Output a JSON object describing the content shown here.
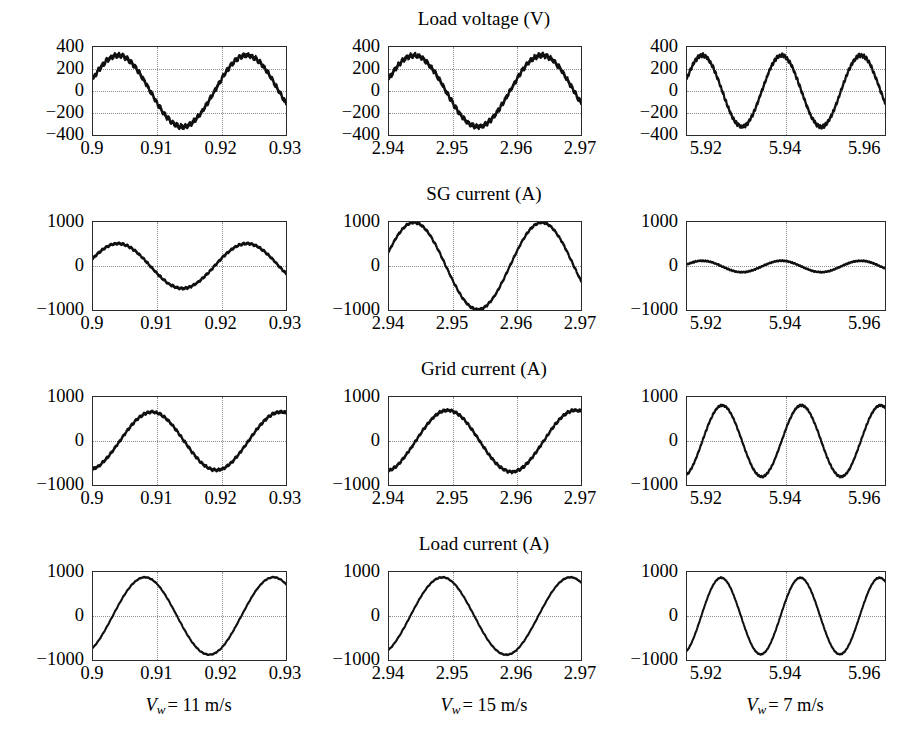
{
  "figure": {
    "rows": [
      {
        "key": "load_voltage",
        "title": "Load voltage (V)",
        "ytick_labels": [
          "400",
          "200",
          "0",
          "−200",
          "−400"
        ],
        "ylim": [
          -400,
          400
        ],
        "gridline_values": [
          200,
          0,
          -200
        ]
      },
      {
        "key": "sg_current",
        "title": "SG current (A)",
        "ytick_labels": [
          "1000",
          "0",
          "−1000"
        ],
        "ylim": [
          -1000,
          1000
        ],
        "gridline_values": [
          0
        ]
      },
      {
        "key": "grid_current",
        "title": "Grid current (A)",
        "ytick_labels": [
          "1000",
          "0",
          "−1000"
        ],
        "ylim": [
          -1000,
          1000
        ],
        "gridline_values": [
          0
        ]
      },
      {
        "key": "load_current",
        "title": "Load current (A)",
        "ytick_labels": [
          "1000",
          "0",
          "−1000"
        ],
        "ylim": [
          -1000,
          1000
        ],
        "gridline_values": [
          0
        ]
      }
    ],
    "columns": [
      {
        "key": "col_11ms",
        "caption_prefix": "V",
        "caption_sub": "w",
        "caption_value": "= 11 m/s",
        "caption_text": "Vw = 11 m/s",
        "xtick_labels": [
          "0.9",
          "0.91",
          "0.92",
          "0.93"
        ],
        "xtick_values": [
          0.9,
          0.91,
          0.92,
          0.93
        ],
        "xlim": [
          0.9,
          0.93
        ],
        "gridline_values": [
          0.91,
          0.92
        ]
      },
      {
        "key": "col_15ms",
        "caption_prefix": "V",
        "caption_sub": "w",
        "caption_value": "= 15 m/s",
        "caption_text": "Vw = 15 m/s",
        "xtick_labels": [
          "2.94",
          "2.95",
          "2.96",
          "2.97"
        ],
        "xtick_values": [
          2.94,
          2.95,
          2.96,
          2.97
        ],
        "xlim": [
          2.94,
          2.97
        ],
        "gridline_values": [
          2.95,
          2.96
        ]
      },
      {
        "key": "col_7ms",
        "caption_prefix": "V",
        "caption_sub": "w",
        "caption_value": "= 7 m/s",
        "caption_text": "Vw = 7 m/s",
        "xtick_labels": [
          "5.92",
          "5.94",
          "5.96"
        ],
        "xtick_values": [
          5.92,
          5.94,
          5.96
        ],
        "xlim": [
          5.915,
          5.965
        ],
        "gridline_values": [
          5.94
        ]
      }
    ]
  },
  "chart_data": {
    "type": "line",
    "grid": {
      "rows": 4,
      "cols": 3
    },
    "row_titles": [
      "Load voltage (V)",
      "SG current (A)",
      "Grid current (A)",
      "Load current (A)"
    ],
    "column_captions": [
      "Vw = 11 m/s",
      "Vw = 15 m/s",
      "Vw = 7 m/s"
    ],
    "xlabel": "",
    "ylabel": "",
    "grid_on": true,
    "legend": "none",
    "panels": [
      {
        "row": "Load voltage (V)",
        "column": "Vw = 11 m/s",
        "xlim": [
          0.9,
          0.93
        ],
        "ylim": [
          -400,
          400
        ],
        "xticks": [
          0.9,
          0.91,
          0.92,
          0.93
        ],
        "yticks": [
          400,
          200,
          0,
          -200,
          -400
        ],
        "waveform": "sine",
        "amplitude": 325,
        "frequency_hz": 50,
        "phase_deg": 20,
        "offset": 0,
        "noise_amplitude": 18,
        "cycles_shown": 1.5
      },
      {
        "row": "Load voltage (V)",
        "column": "Vw = 15 m/s",
        "xlim": [
          2.94,
          2.97
        ],
        "ylim": [
          -400,
          400
        ],
        "xticks": [
          2.94,
          2.95,
          2.96,
          2.97
        ],
        "yticks": [
          400,
          200,
          0,
          -200,
          -400
        ],
        "waveform": "sine",
        "amplitude": 325,
        "frequency_hz": 50,
        "phase_deg": 20,
        "offset": 0,
        "noise_amplitude": 18,
        "cycles_shown": 1.5
      },
      {
        "row": "Load voltage (V)",
        "column": "Vw = 7 m/s",
        "xlim": [
          5.915,
          5.965
        ],
        "ylim": [
          -400,
          400
        ],
        "xticks": [
          5.92,
          5.94,
          5.96
        ],
        "yticks": [
          400,
          200,
          0,
          -200,
          -400
        ],
        "waveform": "sine",
        "amplitude": 325,
        "frequency_hz": 50,
        "phase_deg": 20,
        "offset": 0,
        "noise_amplitude": 14,
        "cycles_shown": 2.5
      },
      {
        "row": "SG current (A)",
        "column": "Vw = 11 m/s",
        "xlim": [
          0.9,
          0.93
        ],
        "ylim": [
          -1000,
          1000
        ],
        "xticks": [
          0.9,
          0.91,
          0.92,
          0.93
        ],
        "yticks": [
          1000,
          0,
          -1000
        ],
        "waveform": "sine",
        "amplitude": 510,
        "frequency_hz": 50,
        "phase_deg": 20,
        "offset": 0,
        "noise_amplitude": 22,
        "cycles_shown": 1.5
      },
      {
        "row": "SG current (A)",
        "column": "Vw = 15 m/s",
        "xlim": [
          2.94,
          2.97
        ],
        "ylim": [
          -1000,
          1000
        ],
        "xticks": [
          2.94,
          2.95,
          2.96,
          2.97
        ],
        "yticks": [
          1000,
          0,
          -1000
        ],
        "waveform": "sine",
        "amplitude": 990,
        "frequency_hz": 50,
        "phase_deg": 20,
        "offset": 0,
        "noise_amplitude": 22,
        "cycles_shown": 1.5
      },
      {
        "row": "SG current (A)",
        "column": "Vw = 7 m/s",
        "xlim": [
          5.915,
          5.965
        ],
        "ylim": [
          -1000,
          1000
        ],
        "xticks": [
          5.92,
          5.94,
          5.96
        ],
        "yticks": [
          1000,
          0,
          -1000
        ],
        "waveform": "sine",
        "amplitude": 130,
        "frequency_hz": 50,
        "phase_deg": 20,
        "offset": -10,
        "noise_amplitude": 12,
        "cycles_shown": 2.5
      },
      {
        "row": "Grid current (A)",
        "column": "Vw = 11 m/s",
        "xlim": [
          0.9,
          0.93
        ],
        "ylim": [
          -1000,
          1000
        ],
        "xticks": [
          0.9,
          0.91,
          0.92,
          0.93
        ],
        "yticks": [
          1000,
          0,
          -1000
        ],
        "waveform": "sine",
        "amplitude": 660,
        "frequency_hz": 50,
        "phase_deg": -75,
        "offset": 0,
        "noise_amplitude": 26,
        "cycles_shown": 1.5
      },
      {
        "row": "Grid current (A)",
        "column": "Vw = 15 m/s",
        "xlim": [
          2.94,
          2.97
        ],
        "ylim": [
          -1000,
          1000
        ],
        "xticks": [
          2.94,
          2.95,
          2.96,
          2.97
        ],
        "yticks": [
          1000,
          0,
          -1000
        ],
        "waveform": "sine",
        "amplitude": 700,
        "frequency_hz": 50,
        "phase_deg": -75,
        "offset": 0,
        "noise_amplitude": 26,
        "cycles_shown": 1.5
      },
      {
        "row": "Grid current (A)",
        "column": "Vw = 7 m/s",
        "xlim": [
          5.915,
          5.965
        ],
        "ylim": [
          -1000,
          1000
        ],
        "xticks": [
          5.92,
          5.94,
          5.96
        ],
        "yticks": [
          1000,
          0,
          -1000
        ],
        "waveform": "sine",
        "amplitude": 810,
        "frequency_hz": 50,
        "phase_deg": -70,
        "offset": 0,
        "noise_amplitude": 18,
        "cycles_shown": 2.5
      },
      {
        "row": "Load current (A)",
        "column": "Vw = 11 m/s",
        "xlim": [
          0.9,
          0.93
        ],
        "ylim": [
          -1000,
          1000
        ],
        "xticks": [
          0.9,
          0.91,
          0.92,
          0.93
        ],
        "yticks": [
          1000,
          0,
          -1000
        ],
        "waveform": "sine",
        "amplitude": 880,
        "frequency_hz": 50,
        "phase_deg": -55,
        "offset": 0,
        "noise_amplitude": 10,
        "cycles_shown": 1.5
      },
      {
        "row": "Load current (A)",
        "column": "Vw = 15 m/s",
        "xlim": [
          2.94,
          2.97
        ],
        "ylim": [
          -1000,
          1000
        ],
        "xticks": [
          2.94,
          2.95,
          2.96,
          2.97
        ],
        "yticks": [
          1000,
          0,
          -1000
        ],
        "waveform": "sine",
        "amplitude": 880,
        "frequency_hz": 50,
        "phase_deg": -60,
        "offset": 0,
        "noise_amplitude": 10,
        "cycles_shown": 1.5
      },
      {
        "row": "Load current (A)",
        "column": "Vw = 7 m/s",
        "xlim": [
          5.915,
          5.965
        ],
        "ylim": [
          -1000,
          1000
        ],
        "xticks": [
          5.92,
          5.94,
          5.96
        ],
        "yticks": [
          1000,
          0,
          -1000
        ],
        "waveform": "sine",
        "amplitude": 870,
        "frequency_hz": 50,
        "phase_deg": -65,
        "offset": 0,
        "noise_amplitude": 10,
        "cycles_shown": 2.5
      }
    ]
  },
  "style": {
    "trace_color": "#101010",
    "axis_color": "#2a2a2a",
    "grid_color": "#8d8d8d",
    "background": "#ffffff"
  }
}
